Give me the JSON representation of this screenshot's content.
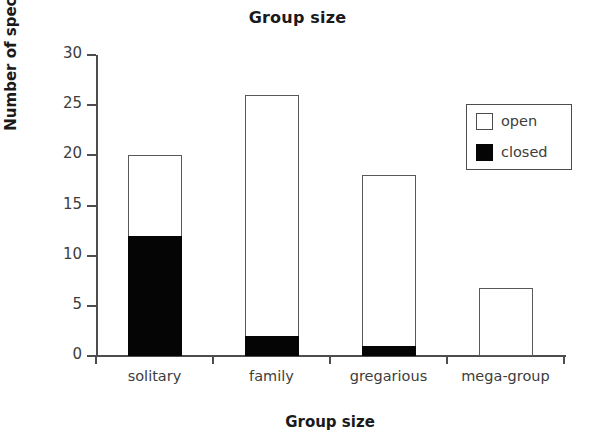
{
  "chart_data": {
    "type": "bar",
    "subtype": "stacked-bar",
    "title": "Group size",
    "xlabel": "Group size",
    "ylabel": "Number of species",
    "categories": [
      "solitary",
      "family",
      "gregarious",
      "mega-group"
    ],
    "series": [
      {
        "name": "closed",
        "color": "#000000",
        "values": [
          12,
          2,
          1,
          0
        ]
      },
      {
        "name": "open",
        "color": "#ffffff",
        "values": [
          8,
          24,
          17,
          6.8
        ]
      }
    ],
    "totals": [
      20,
      26,
      18,
      6.8
    ],
    "ylim": [
      0,
      30
    ],
    "yticks": [
      0,
      5,
      10,
      15,
      20,
      25,
      30
    ],
    "ytick_labels": [
      "0",
      "5",
      "10",
      "15",
      "20",
      "25",
      "30"
    ],
    "grid": false,
    "legend_position": "upper right",
    "legend_entries": [
      {
        "label": "open",
        "swatch": "open"
      },
      {
        "label": "closed",
        "swatch": "closed"
      }
    ]
  }
}
